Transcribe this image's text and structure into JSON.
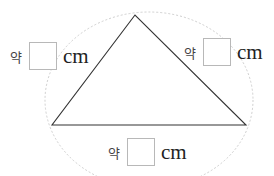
{
  "figure": {
    "shape": "triangle",
    "vertices": {
      "apex": [
        135,
        15
      ],
      "left": [
        52,
        125
      ],
      "right": [
        246,
        125
      ]
    },
    "line_color": "#333333",
    "guide_ellipse": {
      "cx": 149,
      "cy": 100,
      "rx": 104,
      "ry": 88,
      "color": "#cccccc",
      "style": "dotted"
    }
  },
  "labels": {
    "left_side": {
      "prefix": "약",
      "value": "",
      "unit": "cm"
    },
    "right_side": {
      "prefix": "약",
      "value": "",
      "unit": "cm"
    },
    "bottom_side": {
      "prefix": "약",
      "value": "",
      "unit": "cm"
    }
  }
}
